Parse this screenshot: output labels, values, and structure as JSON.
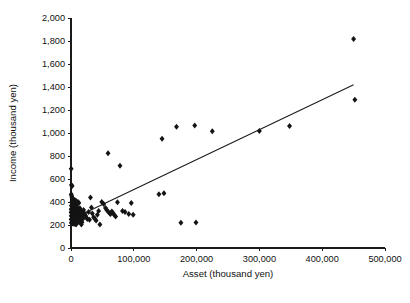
{
  "chart_data": {
    "type": "scatter",
    "title": "",
    "xlabel": "Asset (thousand yen)",
    "ylabel": "Income (thousand yen)",
    "xlim": [
      0,
      500000
    ],
    "ylim": [
      0,
      2000
    ],
    "xticks": [
      0,
      100000,
      200000,
      300000,
      400000,
      500000
    ],
    "yticks": [
      0,
      200,
      400,
      600,
      800,
      1000,
      1200,
      1400,
      1600,
      1800,
      2000
    ],
    "xticklabels": [
      "0",
      "100,000",
      "200,000",
      "300,000",
      "400,000",
      "500,000"
    ],
    "yticklabels": [
      "0",
      "200",
      "400",
      "600",
      "800",
      "1,000",
      "1,200",
      "1,400",
      "1,600",
      "1,800",
      "2,000"
    ],
    "grid": false,
    "legend": null,
    "marker": "diamond",
    "marker_color": "#141414",
    "marker_size": 3.0,
    "series": [
      {
        "name": "Households",
        "points": [
          [
            300,
            690
          ],
          [
            600,
            548
          ],
          [
            1800,
            540
          ],
          [
            400,
            468
          ],
          [
            900,
            455
          ],
          [
            1500,
            440
          ],
          [
            2600,
            430
          ],
          [
            3400,
            424
          ],
          [
            5200,
            418
          ],
          [
            6800,
            412
          ],
          [
            8200,
            408
          ],
          [
            1200,
            400
          ],
          [
            2200,
            396
          ],
          [
            3800,
            392
          ],
          [
            4600,
            388
          ],
          [
            7400,
            386
          ],
          [
            9600,
            382
          ],
          [
            11200,
            400
          ],
          [
            12500,
            392
          ],
          [
            600,
            370
          ],
          [
            1400,
            366
          ],
          [
            2800,
            362
          ],
          [
            4200,
            358
          ],
          [
            5600,
            356
          ],
          [
            7000,
            352
          ],
          [
            8800,
            350
          ],
          [
            10400,
            348
          ],
          [
            13000,
            346
          ],
          [
            14500,
            344
          ],
          [
            300,
            338
          ],
          [
            1000,
            336
          ],
          [
            2000,
            334
          ],
          [
            3200,
            332
          ],
          [
            4400,
            330
          ],
          [
            5800,
            328
          ],
          [
            7200,
            326
          ],
          [
            8600,
            324
          ],
          [
            10000,
            322
          ],
          [
            11800,
            320
          ],
          [
            13500,
            318
          ],
          [
            15200,
            316
          ],
          [
            17000,
            314
          ],
          [
            200,
            310
          ],
          [
            800,
            308
          ],
          [
            1600,
            306
          ],
          [
            2400,
            304
          ],
          [
            3600,
            302
          ],
          [
            4800,
            300
          ],
          [
            6200,
            298
          ],
          [
            7600,
            296
          ],
          [
            9200,
            294
          ],
          [
            10800,
            292
          ],
          [
            12200,
            290
          ],
          [
            14000,
            288
          ],
          [
            16000,
            286
          ],
          [
            18500,
            284
          ],
          [
            400,
            280
          ],
          [
            1100,
            278
          ],
          [
            1900,
            276
          ],
          [
            2700,
            274
          ],
          [
            3500,
            272
          ],
          [
            4300,
            270
          ],
          [
            5400,
            268
          ],
          [
            6600,
            266
          ],
          [
            8000,
            264
          ],
          [
            9400,
            262
          ],
          [
            11000,
            260
          ],
          [
            12800,
            258
          ],
          [
            15800,
            256
          ],
          [
            19000,
            254
          ],
          [
            300,
            250
          ],
          [
            900,
            248
          ],
          [
            1700,
            246
          ],
          [
            2500,
            244
          ],
          [
            3300,
            242
          ],
          [
            4100,
            240
          ],
          [
            5000,
            238
          ],
          [
            6000,
            236
          ],
          [
            7800,
            234
          ],
          [
            9000,
            232
          ],
          [
            10600,
            230
          ],
          [
            12000,
            228
          ],
          [
            14800,
            226
          ],
          [
            17500,
            224
          ],
          [
            500,
            220
          ],
          [
            1300,
            218
          ],
          [
            2100,
            216
          ],
          [
            3000,
            214
          ],
          [
            4000,
            212
          ],
          [
            5500,
            210
          ],
          [
            7100,
            208
          ],
          [
            8400,
            206
          ],
          [
            16500,
            205
          ],
          [
            20000,
            330
          ],
          [
            21500,
            300
          ],
          [
            23000,
            282
          ],
          [
            24500,
            265
          ],
          [
            26000,
            252
          ],
          [
            28000,
            312
          ],
          [
            29500,
            245
          ],
          [
            31000,
            440
          ],
          [
            32500,
            352
          ],
          [
            34000,
            300
          ],
          [
            36000,
            268
          ],
          [
            38000,
            255
          ],
          [
            40000,
            240
          ],
          [
            42000,
            290
          ],
          [
            44000,
            322
          ],
          [
            46000,
            205
          ],
          [
            49000,
            400
          ],
          [
            52000,
            382
          ],
          [
            55000,
            348
          ],
          [
            57000,
            330
          ],
          [
            59000,
            825
          ],
          [
            60000,
            310
          ],
          [
            62000,
            300
          ],
          [
            63000,
            296
          ],
          [
            65000,
            318
          ],
          [
            67000,
            305
          ],
          [
            69000,
            288
          ],
          [
            71000,
            275
          ],
          [
            74000,
            398
          ],
          [
            78000,
            715
          ],
          [
            82000,
            322
          ],
          [
            86000,
            312
          ],
          [
            92000,
            296
          ],
          [
            96000,
            392
          ],
          [
            99000,
            290
          ],
          [
            140000,
            468
          ],
          [
            148000,
            476
          ],
          [
            145000,
            950
          ],
          [
            168000,
            1055
          ],
          [
            175000,
            220
          ],
          [
            197000,
            1065
          ],
          [
            199000,
            222
          ],
          [
            225000,
            1015
          ],
          [
            300000,
            1018
          ],
          [
            348000,
            1060
          ],
          [
            450000,
            1818
          ],
          [
            452000,
            1290
          ]
        ]
      }
    ],
    "trendline": {
      "x0": 0,
      "y0": 248,
      "x1": 450000,
      "y1": 1420,
      "visible": true
    }
  },
  "axes": {
    "x_title": "Asset (thousand yen)",
    "y_title": "Income (thousand yen)"
  }
}
